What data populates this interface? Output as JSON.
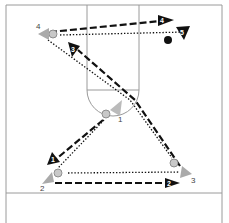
{
  "diagram": {
    "type": "basketball-play",
    "court": {
      "lines_color": "#9a9a9a",
      "background": "#ffffff"
    },
    "players": [
      {
        "id": "4",
        "label": "4",
        "x": 47,
        "y": 33
      },
      {
        "id": "1",
        "label": "1",
        "x": 117,
        "y": 115
      },
      {
        "id": "2",
        "label": "2",
        "x": 46,
        "y": 186
      },
      {
        "id": "3",
        "label": "3",
        "x": 185,
        "y": 176
      }
    ],
    "balls": [
      {
        "x": 53,
        "y": 34
      },
      {
        "x": 106,
        "y": 114
      },
      {
        "x": 58,
        "y": 173
      },
      {
        "x": 174,
        "y": 163
      }
    ],
    "movement_labels": [
      {
        "label": "1",
        "x": 55,
        "y": 161
      },
      {
        "label": "2",
        "x": 168,
        "y": 181
      },
      {
        "label": "3",
        "x": 78,
        "y": 54
      },
      {
        "label": "4",
        "x": 160,
        "y": 21
      },
      {
        "label": "5",
        "x": 182,
        "y": 34
      }
    ],
    "legend_accent": "#111111"
  }
}
